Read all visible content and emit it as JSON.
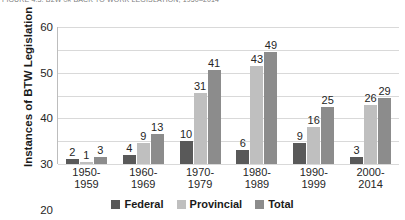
{
  "figure": {
    "caption": "FIGURE 4.3: B2W or BACK TO WORK LEGISLATION, 1950–2014"
  },
  "legend": {
    "items": [
      {
        "label": "Federal",
        "color": "#595959"
      },
      {
        "label": "Provincial",
        "color": "#bfbfbf"
      },
      {
        "label": "Total",
        "color": "#8c8c8c"
      }
    ]
  },
  "chart_data": {
    "type": "bar",
    "title": "FIGURE 4.3: B2W or BACK TO WORK LEGISLATION, 1950–2014",
    "xlabel": "",
    "ylabel": "Instances of BTW Legislation",
    "ylim": [
      0,
      60
    ],
    "yticks": [
      0,
      10,
      20,
      30,
      40,
      50,
      60
    ],
    "grid": true,
    "legend_position": "bottom-center",
    "categories": [
      "1950-1959",
      "1960-1969",
      "1970-1979",
      "1980-1989",
      "1990-1999",
      "2000-2014"
    ],
    "category_lines": [
      [
        "1950-",
        "1959"
      ],
      [
        "1960-",
        "1969"
      ],
      [
        "1970-",
        "1979"
      ],
      [
        "1980-",
        "1989"
      ],
      [
        "1990-",
        "1999"
      ],
      [
        "2000-",
        "2014"
      ]
    ],
    "series": [
      {
        "name": "Federal",
        "color": "#595959",
        "values": [
          2,
          4,
          10,
          6,
          9,
          3
        ]
      },
      {
        "name": "Provincial",
        "color": "#bfbfbf",
        "values": [
          1,
          9,
          31,
          43,
          16,
          26
        ]
      },
      {
        "name": "Total",
        "color": "#8c8c8c",
        "values": [
          3,
          13,
          41,
          49,
          25,
          29
        ]
      }
    ]
  }
}
